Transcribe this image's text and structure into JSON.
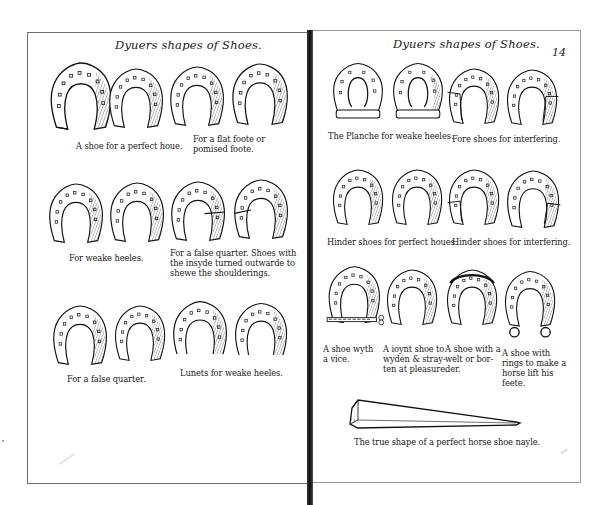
{
  "document": {
    "type": "book-spread",
    "left_page": {
      "running_head": "Dyuers shapes of Shoes.",
      "rows": [
        {
          "shoes": [
            {
              "variant": "open-heel"
            },
            {
              "variant": "open-heel"
            },
            {
              "variant": "closed-round"
            },
            {
              "variant": "closed-round"
            }
          ],
          "captions": [
            {
              "text": "A shoe for a perfect houe.",
              "under": [
                0,
                1
              ]
            },
            {
              "text": "For a flat foote or\npomised foote.",
              "under": [
                2,
                3
              ]
            }
          ]
        },
        {
          "shoes": [
            {
              "variant": "round"
            },
            {
              "variant": "round"
            },
            {
              "variant": "false-quarter"
            },
            {
              "variant": "false-quarter"
            }
          ],
          "captions": [
            {
              "text": "For weake heeles.",
              "under": [
                0,
                1
              ]
            },
            {
              "text": "For a false quarter.  Shoes with\nthe insyde turned outwarde to\nshewe the shoulderings.",
              "under": [
                2,
                3
              ]
            }
          ]
        },
        {
          "shoes": [
            {
              "variant": "half-left"
            },
            {
              "variant": "half-right"
            },
            {
              "variant": "lunet"
            },
            {
              "variant": "lunet"
            }
          ],
          "captions": [
            {
              "text": "For a false quarter.",
              "under": [
                0,
                1
              ]
            },
            {
              "text": "Lunets for weake heeles.",
              "under": [
                2,
                3
              ]
            }
          ]
        }
      ]
    },
    "right_page": {
      "running_head": "Dyuers shapes of Shoes.",
      "folio": "14",
      "rows": [
        {
          "shoes": [
            {
              "variant": "planche"
            },
            {
              "variant": "planche"
            },
            {
              "variant": "interfering"
            },
            {
              "variant": "interfering"
            }
          ],
          "captions": [
            {
              "text": "The Planche for weake heeles.",
              "under": [
                0,
                1
              ]
            },
            {
              "text": "Fore shoes for interfering.",
              "under": [
                2,
                3
              ]
            }
          ]
        },
        {
          "shoes": [
            {
              "variant": "hinder"
            },
            {
              "variant": "hinder"
            },
            {
              "variant": "hinder-interfering"
            },
            {
              "variant": "hinder-interfering"
            }
          ],
          "captions": [
            {
              "text": "Hinder shoes for perfect houes.",
              "under": [
                0,
                1
              ]
            },
            {
              "text": "Hinder shoes for interfering.",
              "under": [
                2,
                3
              ]
            }
          ]
        },
        {
          "shoes": [
            {
              "variant": "vice"
            },
            {
              "variant": "joint"
            },
            {
              "variant": "welt"
            },
            {
              "variant": "rings"
            }
          ],
          "captions": [
            {
              "text": "A shoe wyth\na vice.",
              "under": [
                0
              ]
            },
            {
              "text": "A ioynt shoe to\nwyden & stray-\nten at pleasure.",
              "under": [
                1
              ]
            },
            {
              "text": "A shoe with a\nwelt or bor-\nder.",
              "under": [
                2
              ]
            },
            {
              "text": "A shoe with\nrings to make a\nhorse lift his\nfeete.",
              "under": [
                3
              ]
            }
          ]
        }
      ],
      "nail": {
        "caption": "The true shape of a perfect horse shoe nayle."
      }
    },
    "colors": {
      "ink": "#1a1a1a",
      "paper": "#ffffff",
      "gutter": "#111111",
      "border": "#6e6e6e"
    }
  }
}
